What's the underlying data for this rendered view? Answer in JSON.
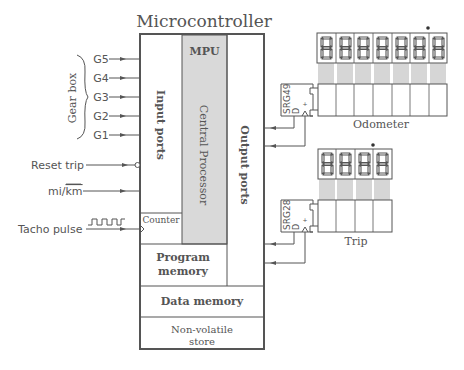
{
  "title": "Microcontroller",
  "colors": {
    "line": "#555555",
    "box_border": "#555555",
    "mpu_fill": "#d9d9d9",
    "text": "#555555",
    "background": "#ffffff"
  },
  "inputs": {
    "group_label": "Gear box",
    "gears": [
      {
        "label": "G5"
      },
      {
        "label": "G4"
      },
      {
        "label": "G3"
      },
      {
        "label": "G2"
      },
      {
        "label": "G1"
      }
    ],
    "reset_trip": "Reset trip",
    "mi_km_left": "mi/",
    "mi_km_right": "km",
    "tacho_pulse": "Tacho pulse"
  },
  "microcontroller": {
    "input_ports": "Input ports",
    "mpu": "MPU",
    "central_processor": "Central Processor",
    "output_ports": "Output ports",
    "counter": "Counter",
    "program_memory_line1": "Program",
    "program_memory_line2": "memory",
    "data_memory": "Data memory",
    "nonvolatile_line1": "Non-volatile",
    "nonvolatile_line2": "store"
  },
  "odometer": {
    "label": "Odometer",
    "register": "SRG49",
    "register_d": "D",
    "digits": 7,
    "decimal_point_position": 6
  },
  "trip": {
    "label": "Trip",
    "register": "SRG28",
    "register_d": "D",
    "digits": 4,
    "decimal_point_position": 3
  }
}
